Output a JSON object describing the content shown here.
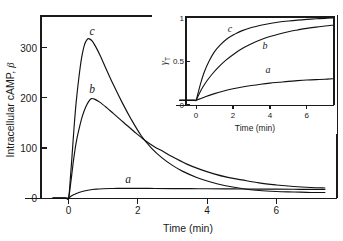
{
  "figure": {
    "background_color": "#ffffff",
    "line_color": "#111111"
  },
  "chart_data": [
    {
      "id": "main",
      "type": "line",
      "title": "",
      "xlabel": "Time (min)",
      "ylabel": "Intracellular cAMP, β",
      "xlim": [
        -0.45,
        7.4
      ],
      "ylim": [
        0,
        380
      ],
      "xticks": [
        0,
        2,
        4,
        6
      ],
      "xticklabels": [
        "0",
        "2",
        "4",
        "6"
      ],
      "yticks": [
        0,
        100,
        200,
        300
      ],
      "yticklabels": [
        "0",
        "100",
        "200",
        "300"
      ],
      "grid": false,
      "legend": "inline-curve-labels",
      "annotations": [
        {
          "text": "c",
          "x": 0.62,
          "y": 345
        },
        {
          "text": "b",
          "x": 0.68,
          "y": 228
        },
        {
          "text": "a",
          "x": 1.95,
          "y": 48
        }
      ],
      "series": [
        {
          "name": "a",
          "label": "a",
          "peak": {
            "x": 1.2,
            "y": 19
          },
          "x": [
            -0.45,
            -0.1,
            0.0,
            0.05,
            0.12,
            0.2,
            0.3,
            0.45,
            0.6,
            0.8,
            1.0,
            1.3,
            1.6,
            2.0,
            2.5,
            3.0,
            3.5,
            4.0,
            4.5,
            5.0,
            5.5,
            6.0,
            6.5,
            7.0,
            7.4
          ],
          "y": [
            0,
            0,
            0,
            2.5,
            5.5,
            8.0,
            11.0,
            14.0,
            16.0,
            17.6,
            18.4,
            19.0,
            19.2,
            19.2,
            19.0,
            18.8,
            18.6,
            18.4,
            18.2,
            18.0,
            17.8,
            17.6,
            17.4,
            17.2,
            17.0
          ]
        },
        {
          "name": "b",
          "label": "b",
          "peak": {
            "x": 0.66,
            "y": 198
          },
          "x": [
            -0.45,
            -0.1,
            0.0,
            0.05,
            0.1,
            0.15,
            0.22,
            0.3,
            0.4,
            0.5,
            0.6,
            0.66,
            0.75,
            0.9,
            1.1,
            1.3,
            1.6,
            1.9,
            2.2,
            2.5,
            2.7,
            3.0,
            3.4,
            3.8,
            4.2,
            4.6,
            5.0,
            5.5,
            6.0,
            6.5,
            7.0,
            7.4
          ],
          "y": [
            0,
            0,
            0,
            22,
            50,
            78,
            110,
            136,
            163,
            182,
            194,
            198,
            197,
            191,
            180,
            168,
            150,
            132,
            115,
            101,
            94,
            82,
            68,
            57,
            48,
            41,
            36,
            30,
            26,
            23,
            21,
            20
          ]
        },
        {
          "name": "c",
          "label": "c",
          "peak": {
            "x": 0.6,
            "y": 317
          },
          "x": [
            -0.45,
            -0.1,
            0.0,
            0.05,
            0.1,
            0.16,
            0.22,
            0.3,
            0.38,
            0.46,
            0.54,
            0.6,
            0.68,
            0.78,
            0.92,
            1.1,
            1.3,
            1.55,
            1.8,
            2.1,
            2.4,
            2.7,
            3.0,
            3.3,
            3.7,
            4.1,
            4.5,
            5.0,
            5.5,
            6.0,
            6.5,
            7.0,
            7.4
          ],
          "y": [
            0,
            0,
            0,
            36,
            82,
            140,
            190,
            240,
            280,
            305,
            316,
            317,
            313,
            302,
            283,
            255,
            225,
            190,
            158,
            124,
            99,
            80,
            65,
            53,
            41,
            32,
            25,
            19,
            15,
            13,
            12,
            11,
            11
          ]
        }
      ]
    },
    {
      "id": "inset",
      "type": "line",
      "title": "",
      "xlabel": "Time (min)",
      "ylabel": "γₜ",
      "xlim": [
        -0.9,
        7.4
      ],
      "ylim": [
        0,
        1.12
      ],
      "xticks": [
        0,
        2,
        4,
        6
      ],
      "xticklabels": [
        "0",
        "2",
        "4",
        "6"
      ],
      "yticks": [
        0,
        0.5,
        1
      ],
      "yticklabels": [
        "0",
        "0.5",
        "1"
      ],
      "grid": false,
      "legend": "inline-curve-labels",
      "annotations": [
        {
          "text": "c",
          "x": 1.45,
          "y": 0.92
        },
        {
          "text": "b",
          "x": 3.4,
          "y": 0.74
        },
        {
          "text": "a",
          "x": 3.5,
          "y": 0.43
        }
      ],
      "series": [
        {
          "name": "a",
          "label": "a",
          "x": [
            -0.9,
            -0.1,
            0.0,
            0.2,
            0.5,
            1.0,
            1.5,
            2.0,
            2.5,
            3.0,
            3.5,
            4.0,
            4.5,
            5.0,
            5.5,
            6.0,
            6.5,
            7.0,
            7.4
          ],
          "y": [
            0.055,
            0.055,
            0.055,
            0.07,
            0.095,
            0.13,
            0.16,
            0.185,
            0.205,
            0.222,
            0.237,
            0.25,
            0.26,
            0.27,
            0.278,
            0.285,
            0.29,
            0.295,
            0.3
          ]
        },
        {
          "name": "b",
          "label": "b",
          "x": [
            -0.9,
            -0.1,
            0.0,
            0.15,
            0.35,
            0.6,
            0.9,
            1.2,
            1.6,
            2.0,
            2.5,
            3.0,
            3.5,
            4.0,
            4.5,
            5.0,
            5.5,
            6.0,
            6.5,
            7.0,
            7.4
          ],
          "y": [
            0.055,
            0.055,
            0.055,
            0.12,
            0.2,
            0.28,
            0.36,
            0.43,
            0.51,
            0.575,
            0.645,
            0.7,
            0.745,
            0.782,
            0.812,
            0.838,
            0.858,
            0.876,
            0.89,
            0.903,
            0.912
          ]
        },
        {
          "name": "c",
          "label": "c",
          "x": [
            -0.9,
            -0.1,
            0.0,
            0.1,
            0.25,
            0.45,
            0.7,
            1.0,
            1.3,
            1.7,
            2.1,
            2.5,
            3.0,
            3.5,
            4.0,
            4.5,
            5.0,
            5.5,
            6.0,
            6.5,
            7.0,
            7.4
          ],
          "y": [
            0.055,
            0.055,
            0.055,
            0.13,
            0.25,
            0.38,
            0.5,
            0.61,
            0.685,
            0.76,
            0.81,
            0.85,
            0.885,
            0.912,
            0.932,
            0.948,
            0.96,
            0.97,
            0.978,
            0.985,
            0.99,
            0.995
          ]
        }
      ]
    }
  ],
  "main_axis": {
    "ylabel": "Intracellular cAMP, β",
    "ylabel_text": "Intracellular cAMP,",
    "ylabel_symbol": "β",
    "xlabel": "Time (min)",
    "yticklabels": [
      "300",
      "200",
      "100",
      "0"
    ],
    "xticklabels": [
      "0",
      "2",
      "4",
      "6"
    ],
    "curve_labels": [
      "c",
      "b",
      "a"
    ]
  },
  "inset_axis": {
    "ylabel_symbol": "γ",
    "ylabel_subscript": "T",
    "xlabel": "Time (min)",
    "yticklabels": [
      "1",
      "0.5",
      "0"
    ],
    "xticklabels": [
      "0",
      "2",
      "4",
      "6"
    ],
    "curve_labels": [
      "c",
      "b",
      "a"
    ]
  }
}
